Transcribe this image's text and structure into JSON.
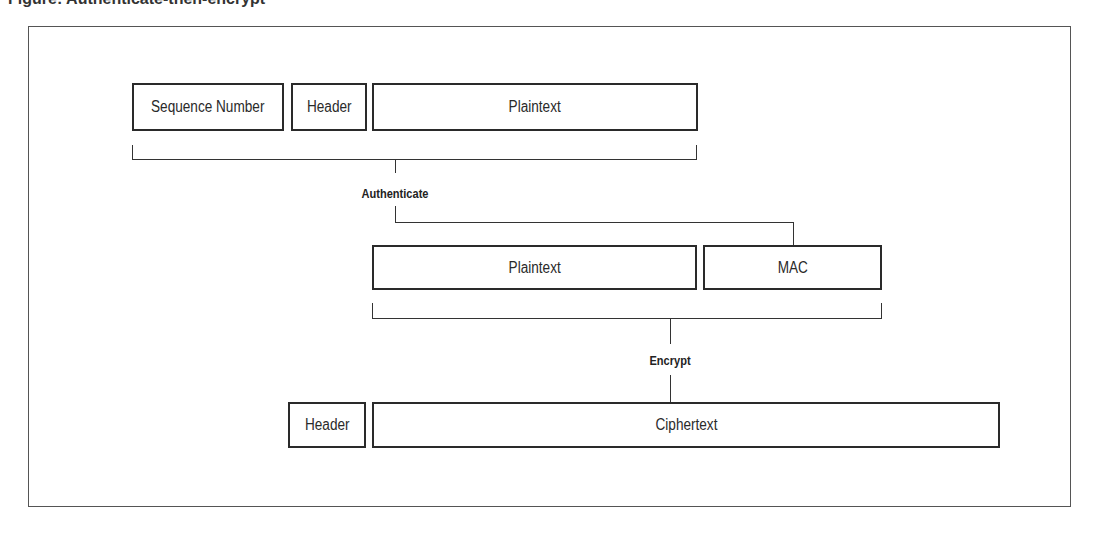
{
  "caption": "Figure: Authenticate-then-encrypt",
  "diagram": {
    "row1": {
      "boxes": [
        {
          "id": "sequence-number",
          "label": "Sequence Number"
        },
        {
          "id": "header",
          "label": "Header"
        },
        {
          "id": "plaintext",
          "label": "Plaintext"
        }
      ]
    },
    "step1_label": "Authenticate",
    "row2": {
      "boxes": [
        {
          "id": "plaintext",
          "label": "Plaintext"
        },
        {
          "id": "mac",
          "label": "MAC"
        }
      ]
    },
    "step2_label": "Encrypt",
    "row3": {
      "boxes": [
        {
          "id": "header",
          "label": "Header"
        },
        {
          "id": "ciphertext",
          "label": "Ciphertext"
        }
      ]
    }
  }
}
